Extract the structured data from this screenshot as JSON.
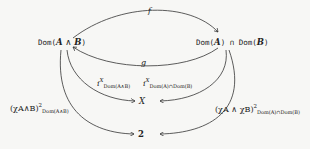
{
  "nodes": {
    "left": {
      "prefix": "Dom(",
      "a": "A",
      "op": " ∧ ",
      "b": "B",
      "suffix": ")"
    },
    "right": {
      "p1": "Dom(",
      "a": "A",
      "m1": ") ∩ ",
      "p2": "Dom(",
      "b": "B",
      "s": ")"
    },
    "x": "X",
    "two": "2"
  },
  "arrows": {
    "f": "f",
    "g": "g",
    "i_left": {
      "base": "i",
      "sup": "X",
      "sub": "Dom(A∧B)"
    },
    "i_right": {
      "base": "i",
      "sup": "X",
      "sub": "Dom(A)∩Dom(B)"
    },
    "chi_left": {
      "base": "(χA∧B)",
      "sup": "2",
      "sub": "Dom(A∧B)"
    },
    "chi_right": {
      "base": "(χA ∧ χB)",
      "sup": "2",
      "sub": "Dom(A)∩Dom(B)"
    }
  }
}
